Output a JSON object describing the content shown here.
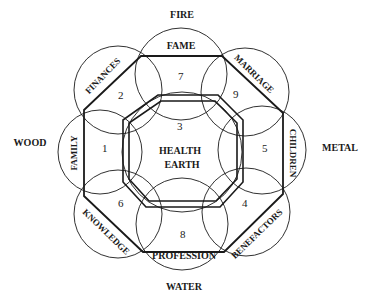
{
  "elements": {
    "fire": "FIRE",
    "wood": "WOOD",
    "metal": "METAL",
    "water": "WATER"
  },
  "center": {
    "line1": "HEALTH",
    "line2": "EARTH",
    "number": "3"
  },
  "areas": [
    {
      "id": "fame",
      "label": "FAME",
      "number": "7"
    },
    {
      "id": "marriage",
      "label": "MARRIAGE",
      "number": "9"
    },
    {
      "id": "children",
      "label": "CHILDREN",
      "number": "5"
    },
    {
      "id": "benefactors",
      "label": "BENEFACTORS",
      "number": "4"
    },
    {
      "id": "profession",
      "label": "PROFESSION",
      "number": "8"
    },
    {
      "id": "knowledge",
      "label": "KNOWLEDGE",
      "number": "6"
    },
    {
      "id": "family",
      "label": "FAMILY",
      "number": "1"
    },
    {
      "id": "finances",
      "label": "FINANCES",
      "number": "2"
    }
  ],
  "colors": {
    "ink": "#1a1a1a",
    "background": "#ffffff"
  }
}
